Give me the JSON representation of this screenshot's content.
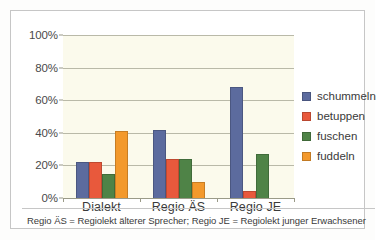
{
  "chart_data": {
    "type": "bar",
    "title": "",
    "subtitle": "",
    "xlabel": "",
    "ylabel": "",
    "categories": [
      "Dialekt",
      "Regio ÄS",
      "Regio JE"
    ],
    "series": [
      {
        "name": "schummeln",
        "color": "#5c6b9e",
        "values": [
          22,
          41.5,
          68
        ]
      },
      {
        "name": "betuppen",
        "color": "#e8593c",
        "values": [
          22,
          24,
          4
        ]
      },
      {
        "name": "fuschen",
        "color": "#4f8347",
        "values": [
          15,
          24,
          27
        ]
      },
      {
        "name": "fuddeln",
        "color": "#f3992c",
        "values": [
          41,
          10,
          0
        ]
      }
    ],
    "ylim": [
      0,
      100
    ],
    "yticks": [
      0,
      20,
      40,
      60,
      80,
      100
    ],
    "ytick_labels": [
      "0%",
      "20%",
      "40%",
      "60%",
      "80%",
      "100%"
    ],
    "grid": true,
    "legend_position": "right",
    "annotations": [
      "Regio ÄS = Regiolekt älterer Sprecher; Regio JE = Regiolekt junger Erwachsener"
    ],
    "plot_background": "#fbfaec",
    "figure_background": "#ffffff"
  },
  "footnote": {
    "text": "Regio ÄS = Regiolekt älterer Sprecher; Regio JE = Regiolekt junger Erwachsener"
  }
}
